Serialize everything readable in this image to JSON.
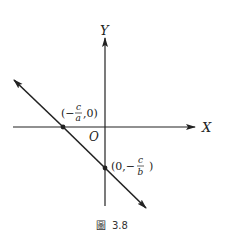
{
  "figure": {
    "caption_label": "圖",
    "caption_number": "3.8",
    "axes": {
      "x_label": "X",
      "y_label": "Y",
      "origin_label": "O"
    },
    "points": [
      {
        "name": "x-intercept",
        "open": "(−",
        "numerator": "c",
        "denominator": "a",
        "close": ",0)"
      },
      {
        "name": "y-intercept",
        "open": "(0,−",
        "numerator": "c",
        "denominator": "b",
        "close": ")"
      }
    ],
    "colors": {
      "ink": "#222222",
      "background": "#ffffff"
    }
  }
}
